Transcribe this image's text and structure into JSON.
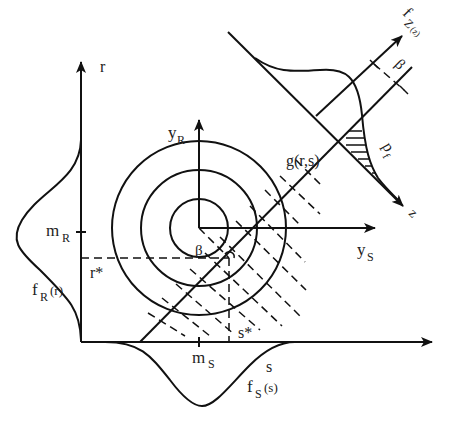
{
  "diagram": {
    "labels": {
      "r_axis": "r",
      "s_axis": "s",
      "yR_main": "y",
      "yR_sub": "R",
      "yS_main": "y",
      "yS_sub": "S",
      "mR_main": "m",
      "mR_sub": "R",
      "mS_main": "m",
      "mS_sub": "S",
      "r_star": "r*",
      "s_star": "s*",
      "fR_main": "f",
      "fR_sub": "R",
      "fR_arg": "(r)",
      "fS_main": "f",
      "fS_sub": "S",
      "fS_arg": "(s)",
      "limit_state": "g(r,s)",
      "beta_center": "β",
      "beta_offset": "β",
      "fZ_main": "f",
      "fZ_sub": "Z",
      "fZ_arg": "(z)",
      "pf_main": "p",
      "pf_sub": "f",
      "z_axis": "z"
    },
    "contour_count": 3,
    "colors": {
      "ink": "#111111",
      "background": "#ffffff"
    }
  }
}
